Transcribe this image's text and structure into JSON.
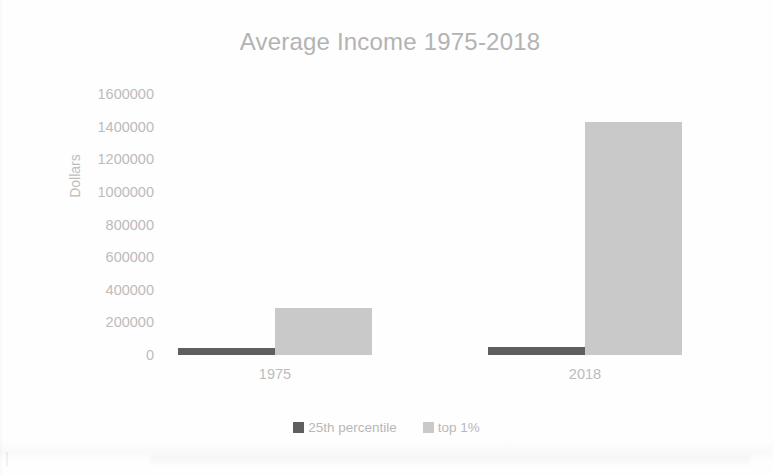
{
  "chart_data": {
    "type": "bar",
    "title": "Average Income 1975-2018",
    "xlabel": "",
    "ylabel": "Dollars",
    "categories": [
      "1975",
      "2018"
    ],
    "series": [
      {
        "name": "25th percentile",
        "color": "#5f5f5f",
        "values": [
          45000,
          48000
        ]
      },
      {
        "name": "top 1%",
        "color": "#c9c9c9",
        "values": [
          290000,
          1430000
        ]
      }
    ],
    "ylim": [
      0,
      1600000
    ],
    "ytick_step": 200000,
    "yticks": [
      "1600000",
      "1400000",
      "1200000",
      "1000000",
      "800000",
      "600000",
      "400000",
      "200000",
      "0"
    ],
    "ytick_values": [
      1600000,
      1400000,
      1200000,
      1000000,
      800000,
      600000,
      400000,
      200000,
      0
    ],
    "grid": false,
    "legend_position": "bottom",
    "background_color": "#ffffff",
    "text_color": "#bcbcbc"
  }
}
